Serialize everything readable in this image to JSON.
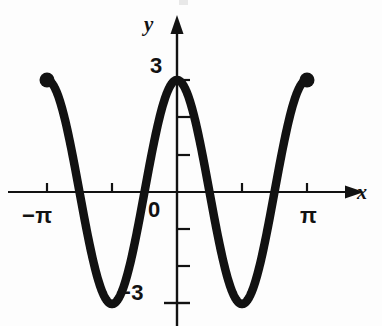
{
  "figure": {
    "background_color": "#fdfdfd",
    "ink_color": "#121212",
    "axis_labels": {
      "x": "x",
      "y": "y"
    },
    "tick_labels": {
      "y_top": "3",
      "y_bottom": "−3",
      "origin": "0",
      "x_left": "−π",
      "x_right": "π"
    }
  },
  "chart_data": {
    "type": "line",
    "title": "",
    "subtitle": "",
    "xlabel": "x",
    "ylabel": "y",
    "function": "y = 3 cos(2x)",
    "amplitude": 3,
    "period": 3.141592653589793,
    "xlim": [
      -3.141592653589793,
      3.141592653589793
    ],
    "ylim": [
      -3.6,
      3.6
    ],
    "grid": false,
    "legend": null,
    "x_tick_values": [
      -3.141592653589793,
      -1.5707963267948966,
      1.5707963267948966,
      3.141592653589793
    ],
    "x_tick_labels": [
      "−π",
      "",
      "",
      "π"
    ],
    "y_tick_values": [
      -3,
      -2,
      -1,
      1,
      2,
      3
    ],
    "y_tick_labels": [
      "−3",
      "",
      "",
      "",
      "",
      "3"
    ],
    "endpoints": [
      {
        "x": -3.141592653589793,
        "y": 3,
        "marker": "filled-circle"
      },
      {
        "x": 3.141592653589793,
        "y": 3,
        "marker": "filled-circle"
      }
    ],
    "key_points": {
      "maxima": [
        {
          "x": -3.141592653589793,
          "y": 3
        },
        {
          "x": 0,
          "y": 3
        },
        {
          "x": 3.141592653589793,
          "y": 3
        }
      ],
      "minima": [
        {
          "x": -1.5707963267948966,
          "y": -3
        },
        {
          "x": 1.5707963267948966,
          "y": -3
        }
      ],
      "zeros": [
        -2.356194490192345,
        -0.7853981633974483,
        0.7853981633974483,
        2.356194490192345
      ]
    },
    "series": [
      {
        "name": "y = 3 cos(2x)",
        "x": [
          -3.1416,
          -3.0,
          -2.85,
          -2.7,
          -2.55,
          -2.4,
          -2.25,
          -2.1,
          -1.95,
          -1.8,
          -1.65,
          -1.5708,
          -1.5,
          -1.35,
          -1.2,
          -1.05,
          -0.9,
          -0.75,
          -0.6,
          -0.45,
          -0.3,
          -0.15,
          0.0,
          0.15,
          0.3,
          0.45,
          0.6,
          0.75,
          0.9,
          1.05,
          1.2,
          1.35,
          1.5,
          1.5708,
          1.65,
          1.8,
          1.95,
          2.1,
          2.25,
          2.4,
          2.55,
          2.7,
          2.85,
          3.0,
          3.1416
        ],
        "y": [
          3.0,
          2.884,
          2.382,
          1.604,
          0.646,
          -0.374,
          -1.336,
          -2.13,
          -2.676,
          -2.941,
          -2.934,
          -3.0,
          -2.979,
          -2.529,
          -1.812,
          -0.899,
          0.124,
          1.134,
          2.011,
          2.646,
          2.947,
          2.867,
          3.0,
          2.867,
          2.947,
          2.646,
          2.011,
          1.134,
          0.124,
          -0.899,
          -1.812,
          -2.529,
          -2.979,
          -3.0,
          -2.934,
          -2.941,
          -2.676,
          -2.13,
          -1.336,
          -0.374,
          0.646,
          1.604,
          2.382,
          2.884,
          3.0
        ]
      }
    ]
  }
}
